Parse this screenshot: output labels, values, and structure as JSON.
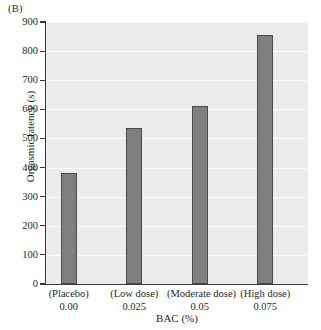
{
  "panel": {
    "label": "(B)"
  },
  "chart_data": {
    "type": "bar",
    "title": "",
    "subtitle": "",
    "xlabel": "BAC (%)",
    "ylabel": "Orgasmic latency (s)",
    "categories": [
      "(Placebo)",
      "(Low dose)",
      "(Moderate dose)",
      "(High dose)"
    ],
    "category_values": [
      "0.00",
      "0.025",
      "0.05",
      "0.075"
    ],
    "values": [
      380,
      535,
      613,
      855
    ],
    "ylim": [
      0,
      900
    ],
    "yticks": [
      0,
      100,
      200,
      300,
      400,
      500,
      600,
      700,
      800,
      900
    ],
    "ytick_labels": [
      "0",
      "100",
      "200",
      "300",
      "400",
      "500",
      "600",
      "700",
      "800",
      "900"
    ],
    "grid": true,
    "legend": false,
    "bar_color": "#7f7f7f",
    "bar_edge_color": "#4a4a4a",
    "plot_background": "#ececec",
    "gridline_color": "#fafafa",
    "axis_color": "#3a3a3a"
  }
}
